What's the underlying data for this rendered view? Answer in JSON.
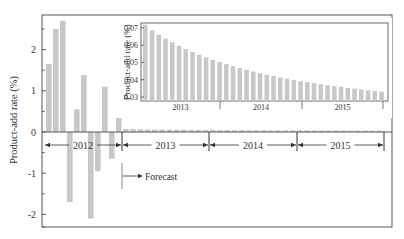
{
  "chart_data": [
    {
      "id": "main",
      "type": "bar",
      "title": "",
      "xlabel": "",
      "ylabel": "Product-add rate (%)",
      "ylim": [
        -2.3,
        2.8
      ],
      "yticks": [
        -2,
        -1,
        0,
        1,
        2
      ],
      "ytick_labels": [
        "-2",
        "-1",
        "0",
        "1",
        "2"
      ],
      "grid": false,
      "legend": null,
      "bar_color": "#c8c8c8",
      "series": [
        {
          "name": "2012 monthly product-add rate",
          "period": "2012",
          "categories": [
            "Jan",
            "Feb",
            "Mar",
            "Apr",
            "May",
            "Jun",
            "Jul",
            "Aug",
            "Sep",
            "Oct",
            "Nov",
            "Dec"
          ],
          "values": [
            1.65,
            2.5,
            2.7,
            -1.7,
            0.55,
            1.38,
            -2.1,
            -0.95,
            1.1,
            -0.65,
            1.75,
            0.07
          ]
        },
        {
          "name": "Forecast 2013-2015",
          "period": "2013-2015",
          "values_ref": "inset.series.0.values"
        }
      ],
      "period_brackets": [
        {
          "label": "2012",
          "from": 0,
          "to": 11
        },
        {
          "label": "2013",
          "from": 12,
          "to": 23
        },
        {
          "label": "2014",
          "from": 24,
          "to": 35
        },
        {
          "label": "2015",
          "from": 36,
          "to": 47
        }
      ],
      "annotations": [
        {
          "text": "Forecast",
          "type": "arrow-right",
          "at_index": 12
        }
      ]
    },
    {
      "id": "inset",
      "type": "bar",
      "title": "",
      "xlabel": "",
      "ylabel": "Product-add rate (%)",
      "ylim": [
        0.028,
        0.073
      ],
      "yticks": [
        0.03,
        0.04,
        0.05,
        0.06,
        0.07
      ],
      "ytick_labels": [
        "0.03",
        "0.04",
        "0.05",
        "0.06",
        "0.07"
      ],
      "grid": false,
      "legend": null,
      "bar_color": "#c8c8c8",
      "x_group_labels": [
        "2013",
        "2014",
        "2015"
      ],
      "series": [
        {
          "name": "Forecast monthly product-add rate",
          "values": [
            0.0718,
            0.0685,
            0.066,
            0.0637,
            0.0616,
            0.0596,
            0.0577,
            0.056,
            0.0544,
            0.0529,
            0.0515,
            0.0502,
            0.049,
            0.0478,
            0.0467,
            0.0457,
            0.0447,
            0.0438,
            0.0429,
            0.0421,
            0.0413,
            0.0406,
            0.0399,
            0.0392,
            0.0386,
            0.038,
            0.0374,
            0.0368,
            0.0363,
            0.0358,
            0.0353,
            0.0348,
            0.0343,
            0.0339,
            0.0335,
            0.0331
          ]
        }
      ]
    }
  ],
  "labels": {
    "main_ylabel": "Product-add rate (%)",
    "inset_ylabel": "Product-add rate (%)",
    "forecast": "Forecast"
  }
}
